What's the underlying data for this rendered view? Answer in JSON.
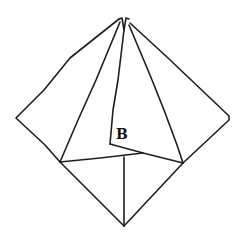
{
  "diagram": {
    "stroke_color": "#1e1e1e",
    "background": "#ffffff",
    "labels": [
      {
        "id": "B",
        "text": "B"
      }
    ],
    "points": {
      "top_left_tip": [
        121,
        18
      ],
      "top_right_tip": [
        128,
        18
      ],
      "left_corner": [
        16,
        118
      ],
      "right_corner": [
        229,
        120
      ],
      "inner_fold_top": [
        124,
        22
      ],
      "b_corner": [
        110,
        144
      ],
      "b_kink": [
        143,
        153
      ],
      "lower_left": [
        60,
        162
      ],
      "lower_right": [
        183,
        163
      ],
      "center_bottom_fold": [
        123,
        157
      ],
      "bottom_tip": [
        124,
        226
      ]
    }
  }
}
